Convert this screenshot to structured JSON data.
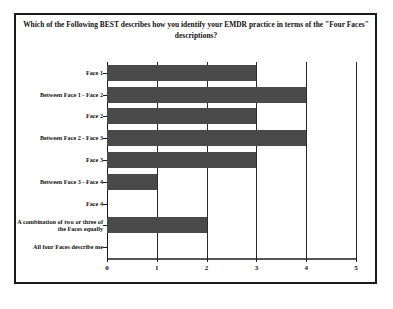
{
  "chart_data": {
    "type": "bar",
    "orientation": "horizontal",
    "title": "Which of the Following BEST describes how you identify your EMDR practice in terms of the \"Four Faces\" descriptions?",
    "xlabel": "",
    "ylabel": "",
    "xlim": [
      0,
      5
    ],
    "xticks": [
      "0",
      "1",
      "2",
      "3",
      "4",
      "5"
    ],
    "grid": true,
    "legend": false,
    "bar_color": "#4a4a4a",
    "categories": [
      "Face 1",
      "Between Face 1 - Face 2",
      "Face 2",
      "Between Face 2 - Face 3",
      "Face 3",
      "Between Face 3 - Face 4",
      "Face 4",
      "A combination of two or three of the Faces equally",
      "All four Faces describe me"
    ],
    "values": [
      3,
      4,
      3,
      4,
      3,
      1,
      0,
      2,
      0
    ]
  }
}
